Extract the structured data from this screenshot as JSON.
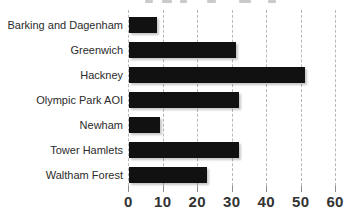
{
  "chart_data": {
    "type": "bar",
    "orientation": "horizontal",
    "categories": [
      "Barking and Dagenham",
      "Greenwich",
      "Hackney",
      "Olympic Park AOI",
      "Newham",
      "Tower Hamlets",
      "Waltham Forest"
    ],
    "values": [
      8,
      31,
      51,
      32,
      9,
      32,
      22.5
    ],
    "xlim": [
      0,
      60
    ],
    "x_tick_values": [
      0,
      10,
      20,
      30,
      40,
      50,
      60
    ],
    "x_tick_labels": [
      "0",
      "10",
      "20",
      "30",
      "40",
      "50",
      "60"
    ],
    "grid": "vertical-dashed",
    "legend": "none",
    "bar_color": "#111111",
    "gridline_color": "#b8b8b8",
    "category_label_color": "#2b2b2b",
    "tick_label_color": "#333333",
    "background_color": "#ffffff"
  }
}
